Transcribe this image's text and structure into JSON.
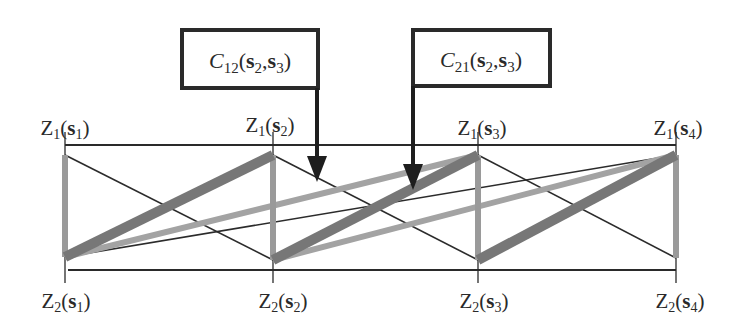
{
  "diagram": {
    "type": "bipartite-cross-covariance-diagram",
    "nodes": {
      "top": [
        {
          "id": "Z1_s1",
          "var": "Z",
          "var_sub": "1",
          "site": "s",
          "site_sub": "1",
          "x": 65,
          "y": 155
        },
        {
          "id": "Z1_s2",
          "var": "Z",
          "var_sub": "1",
          "site": "s",
          "site_sub": "2",
          "x": 273,
          "y": 155
        },
        {
          "id": "Z1_s3",
          "var": "Z",
          "var_sub": "1",
          "site": "s",
          "site_sub": "3",
          "x": 478,
          "y": 155
        },
        {
          "id": "Z1_s4",
          "var": "Z",
          "var_sub": "1",
          "site": "s",
          "site_sub": "4",
          "x": 676,
          "y": 155
        }
      ],
      "bottom": [
        {
          "id": "Z2_s1",
          "var": "Z",
          "var_sub": "2",
          "site": "s",
          "site_sub": "1",
          "x": 65,
          "y": 257
        },
        {
          "id": "Z2_s2",
          "var": "Z",
          "var_sub": "2",
          "site": "s",
          "site_sub": "2",
          "x": 273,
          "y": 260
        },
        {
          "id": "Z2_s3",
          "var": "Z",
          "var_sub": "2",
          "site": "s",
          "site_sub": "3",
          "x": 478,
          "y": 260
        },
        {
          "id": "Z2_s4",
          "var": "Z",
          "var_sub": "2",
          "site": "s",
          "site_sub": "4",
          "x": 676,
          "y": 258
        }
      ]
    },
    "labels": {
      "top": [
        "Z1(s1)",
        "Z1(s2)",
        "Z1(s3)",
        "Z1(s4)"
      ],
      "bottom": [
        "Z2(s1)",
        "Z2(s2)",
        "Z2(s3)",
        "Z2(s4)"
      ]
    },
    "callouts": [
      {
        "id": "C12",
        "func": "C",
        "func_sub": "12",
        "arg1": "s",
        "arg1_sub": "2",
        "arg2": "s",
        "arg2_sub": "3",
        "text": "C12(s2,s3)"
      },
      {
        "id": "C21",
        "func": "C",
        "func_sub": "21",
        "arg1": "s",
        "arg1_sub": "2",
        "arg2": "s",
        "arg2_sub": "3",
        "text": "C21(s2,s3)"
      }
    ],
    "edge_styles": {
      "thin": {
        "color": "#2b2b2b",
        "width": 1.6
      },
      "light_thick": {
        "color": "#a0a0a0",
        "width": 6
      },
      "mid_thick": {
        "color": "#9a9a9a",
        "width": 6
      },
      "dark_thick": {
        "color": "#777777",
        "width": 10
      }
    },
    "colors": {
      "axis": "#2a2a2a",
      "text": "#2a2a2a",
      "box_border": "#2a2a2a",
      "arrow": "#1e1e1e"
    }
  }
}
